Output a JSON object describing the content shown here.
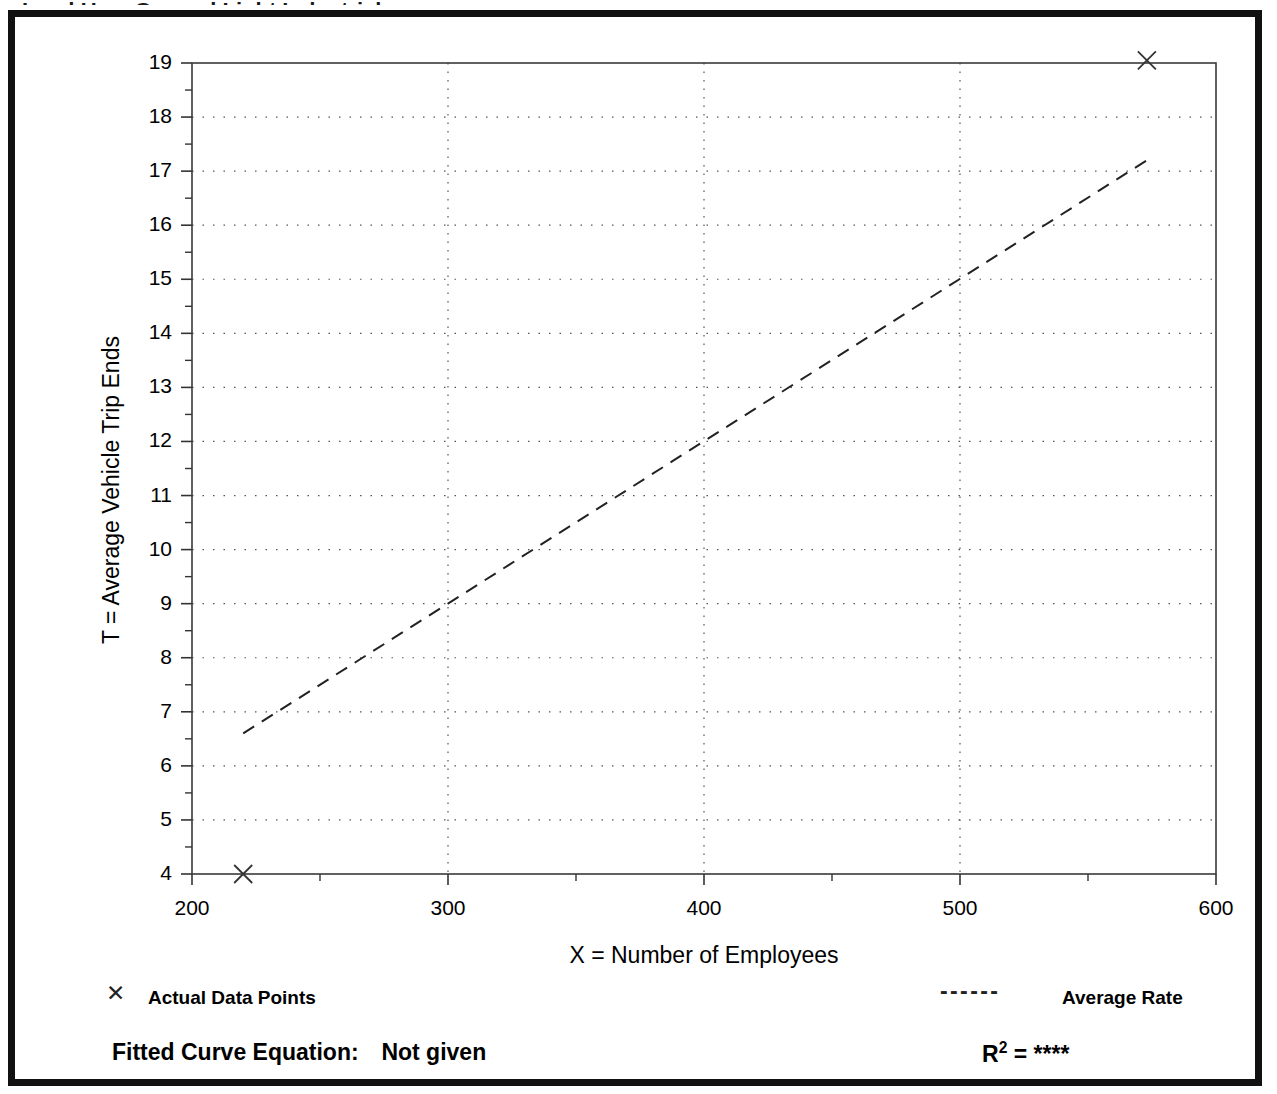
{
  "figure": {
    "title_clipped": "Land Use:  General Light Industrial",
    "border_color": "#111111"
  },
  "axes": {
    "y_title": "T = Average Vehicle Trip Ends",
    "x_title": "X = Number of Employees",
    "y_ticks": [
      "4",
      "5",
      "6",
      "7",
      "8",
      "9",
      "10",
      "11",
      "12",
      "13",
      "14",
      "15",
      "16",
      "17",
      "18",
      "19"
    ],
    "x_ticks": [
      "200",
      "300",
      "400",
      "500",
      "600"
    ]
  },
  "legend": {
    "data_points_marker": "✕",
    "data_points_label": "Actual Data Points",
    "average_rate_marker": "- - - - - -",
    "average_rate_label": "Average Rate",
    "equation_label": "Fitted Curve Equation:",
    "equation_value": "Not given",
    "r2_prefix": "R",
    "r2_exponent": "2",
    "r2_equals": "=",
    "r2_value": "****"
  },
  "chart_data": {
    "type": "scatter",
    "title": "Land Use:  General Light Industrial",
    "xlabel": "X = Number of Employees",
    "ylabel": "T = Average Vehicle Trip Ends",
    "xlim": [
      200,
      600
    ],
    "ylim": [
      4,
      19
    ],
    "x_major_ticks": [
      200,
      300,
      400,
      500,
      600
    ],
    "x_minor_step": 50,
    "y_major_ticks": [
      4,
      5,
      6,
      7,
      8,
      9,
      10,
      11,
      12,
      13,
      14,
      15,
      16,
      17,
      18,
      19
    ],
    "y_minor_step": 0.5,
    "grid": true,
    "legend_position": "below-axes",
    "series": [
      {
        "name": "Actual Data Points",
        "type": "scatter",
        "marker": "x",
        "points": [
          {
            "x": 220,
            "y": 4.0
          },
          {
            "x": 573,
            "y": 19.05
          }
        ]
      },
      {
        "name": "Average Rate",
        "type": "line",
        "style": "dashed",
        "points": [
          {
            "x": 220,
            "y": 6.6
          },
          {
            "x": 573,
            "y": 17.2
          }
        ]
      }
    ],
    "annotations": [
      {
        "text": "Fitted Curve Equation:  Not given"
      },
      {
        "text": "R2 = ****"
      }
    ]
  }
}
